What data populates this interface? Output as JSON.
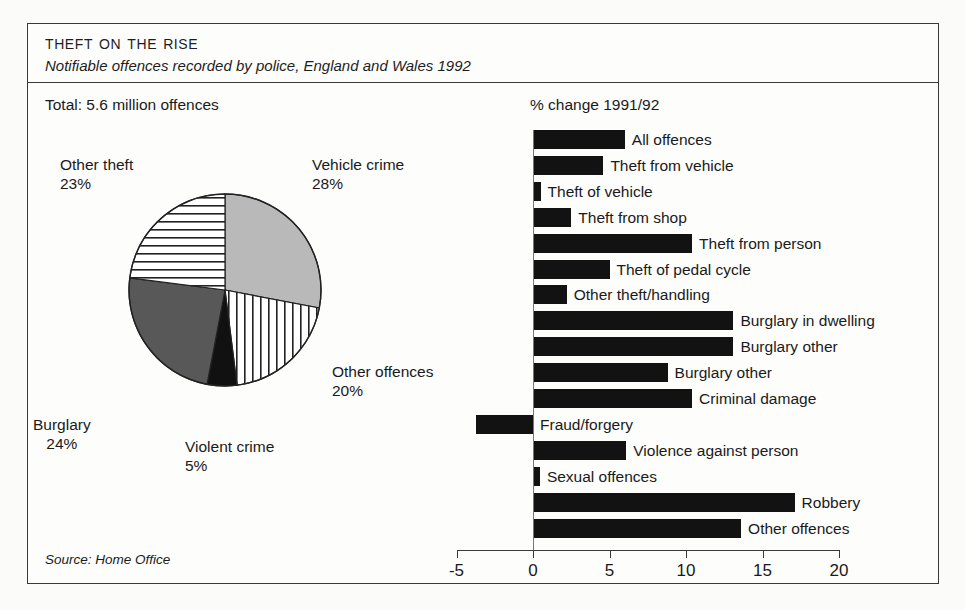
{
  "figure": {
    "title": "Theft on the Rise",
    "subtitle": "Notifiable offences recorded by police, England and Wales 1992",
    "total_label": "Total: 5.6 million offences",
    "percent_change_label": "% change 1991/92",
    "source": "Source: Home Office"
  },
  "chart_data": [
    {
      "type": "pie",
      "title": "Total: 5.6 million offences",
      "unit": "%",
      "legend": "labels-outside",
      "categories": [
        "Vehicle crime",
        "Other offences",
        "Violent crime",
        "Burglary",
        "Other theft"
      ],
      "values": [
        28,
        20,
        5,
        24,
        23
      ],
      "slices": [
        {
          "label": "Vehicle crime",
          "value": 28,
          "value_text": "28%",
          "fill": "solid-grey",
          "color": "#b9b9b9"
        },
        {
          "label": "Other offences",
          "value": 20,
          "value_text": "20%",
          "fill": "vertical-stripes",
          "color": "#ffffff"
        },
        {
          "label": "Violent crime",
          "value": 5,
          "value_text": "5%",
          "fill": "solid-black",
          "color": "#111111"
        },
        {
          "label": "Burglary",
          "value": 24,
          "value_text": "24%",
          "fill": "solid-dark-grey",
          "color": "#585858"
        },
        {
          "label": "Other theft",
          "value": 23,
          "value_text": "23%",
          "fill": "horizontal-stripes",
          "color": "#ffffff"
        }
      ]
    },
    {
      "type": "bar",
      "orientation": "horizontal",
      "title": "% change 1991/92",
      "xlabel": "",
      "ylabel": "",
      "xlim": [
        -5,
        20
      ],
      "xticks": [
        -5,
        0,
        5,
        10,
        15,
        20
      ],
      "xtick_labels": [
        "-5",
        "0",
        "5",
        "10",
        "15",
        "20"
      ],
      "grid": false,
      "bar_color": "#121212",
      "categories": [
        "All offences",
        "Theft from vehicle",
        "Theft of vehicle",
        "Theft from shop",
        "Theft from person",
        "Theft of pedal cycle",
        "Other theft/handling",
        "Burglary in dwelling",
        "Burglary other",
        "Burglary other",
        "Criminal damage",
        "Fraud/forgery",
        "Violence against person",
        "Sexual offences",
        "Robbery",
        "Other offences"
      ],
      "values": [
        6.0,
        4.6,
        0.5,
        2.5,
        10.4,
        5.0,
        2.2,
        13.1,
        13.1,
        8.8,
        10.4,
        -3.7,
        6.1,
        0.45,
        17.1,
        13.6
      ]
    }
  ]
}
